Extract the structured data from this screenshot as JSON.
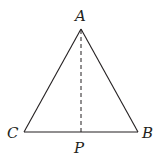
{
  "diagram": {
    "type": "isosceles-triangle-with-altitude",
    "stroke_color": "#231f20",
    "background": "#ffffff",
    "points": {
      "A": {
        "label": "A",
        "x": 81,
        "y": 29
      },
      "B": {
        "label": "B",
        "x": 138,
        "y": 132
      },
      "C": {
        "label": "C",
        "x": 24,
        "y": 132
      },
      "P": {
        "label": "P",
        "x": 81,
        "y": 132
      }
    },
    "segments": [
      {
        "from": "A",
        "to": "B",
        "style": "solid"
      },
      {
        "from": "A",
        "to": "C",
        "style": "solid"
      },
      {
        "from": "C",
        "to": "B",
        "style": "solid"
      },
      {
        "from": "A",
        "to": "P",
        "style": "dashed"
      }
    ],
    "labels": {
      "A": "A",
      "B": "B",
      "C": "C",
      "P": "P"
    }
  }
}
